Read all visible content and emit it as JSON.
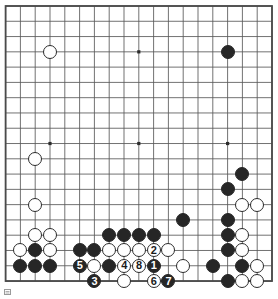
{
  "board": {
    "name": "go-board",
    "size": 19,
    "origin_x": 5.6,
    "origin_y": 6.0,
    "pitch_x": 14.8,
    "pitch_y": 15.28,
    "stone_radius": 7.0,
    "line_color": "#595959",
    "border_color": "#4a4a4a",
    "background_color": "#ffffff",
    "black_color": "#262626",
    "white_color": "#ffffff",
    "star_points": [
      {
        "col": 4,
        "row": 4
      },
      {
        "col": 10,
        "row": 4
      },
      {
        "col": 16,
        "row": 4
      },
      {
        "col": 4,
        "row": 10
      },
      {
        "col": 10,
        "row": 10
      },
      {
        "col": 16,
        "row": 10
      },
      {
        "col": 4,
        "row": 16
      },
      {
        "col": 10,
        "row": 16
      },
      {
        "col": 16,
        "row": 16
      }
    ]
  },
  "stones": [
    {
      "col": 4,
      "row": 4,
      "color": "white",
      "label": ""
    },
    {
      "col": 16,
      "row": 4,
      "color": "black",
      "label": ""
    },
    {
      "col": 3,
      "row": 11,
      "color": "white",
      "label": ""
    },
    {
      "col": 3,
      "row": 14,
      "color": "white",
      "label": ""
    },
    {
      "col": 17,
      "row": 12,
      "color": "black",
      "label": ""
    },
    {
      "col": 16,
      "row": 13,
      "color": "black",
      "label": ""
    },
    {
      "col": 17,
      "row": 14,
      "color": "white",
      "label": ""
    },
    {
      "col": 18,
      "row": 14,
      "color": "white",
      "label": ""
    },
    {
      "col": 13,
      "row": 15,
      "color": "black",
      "label": ""
    },
    {
      "col": 16,
      "row": 15,
      "color": "black",
      "label": ""
    },
    {
      "col": 3,
      "row": 16,
      "color": "white",
      "label": ""
    },
    {
      "col": 4,
      "row": 16,
      "color": "white",
      "label": ""
    },
    {
      "col": 8,
      "row": 16,
      "color": "black",
      "label": ""
    },
    {
      "col": 9,
      "row": 16,
      "color": "black",
      "label": ""
    },
    {
      "col": 10,
      "row": 16,
      "color": "black",
      "label": ""
    },
    {
      "col": 11,
      "row": 16,
      "color": "black",
      "label": ""
    },
    {
      "col": 16,
      "row": 16,
      "color": "black",
      "label": ""
    },
    {
      "col": 17,
      "row": 16,
      "color": "white",
      "label": ""
    },
    {
      "col": 2,
      "row": 17,
      "color": "white",
      "label": ""
    },
    {
      "col": 3,
      "row": 17,
      "color": "black",
      "label": ""
    },
    {
      "col": 4,
      "row": 17,
      "color": "white",
      "label": ""
    },
    {
      "col": 6,
      "row": 17,
      "color": "black",
      "label": ""
    },
    {
      "col": 7,
      "row": 17,
      "color": "black",
      "label": ""
    },
    {
      "col": 8,
      "row": 17,
      "color": "white",
      "label": ""
    },
    {
      "col": 9,
      "row": 17,
      "color": "white",
      "label": ""
    },
    {
      "col": 10,
      "row": 17,
      "color": "white",
      "label": ""
    },
    {
      "col": 11,
      "row": 17,
      "color": "white",
      "label": "2"
    },
    {
      "col": 12,
      "row": 17,
      "color": "white",
      "label": ""
    },
    {
      "col": 16,
      "row": 17,
      "color": "black",
      "label": ""
    },
    {
      "col": 17,
      "row": 17,
      "color": "white",
      "label": ""
    },
    {
      "col": 2,
      "row": 18,
      "color": "black",
      "label": ""
    },
    {
      "col": 3,
      "row": 18,
      "color": "black",
      "label": ""
    },
    {
      "col": 4,
      "row": 18,
      "color": "black",
      "label": ""
    },
    {
      "col": 6,
      "row": 18,
      "color": "black",
      "label": "5"
    },
    {
      "col": 7,
      "row": 18,
      "color": "white",
      "label": ""
    },
    {
      "col": 8,
      "row": 18,
      "color": "black",
      "label": ""
    },
    {
      "col": 9,
      "row": 18,
      "color": "white",
      "label": "4"
    },
    {
      "col": 10,
      "row": 18,
      "color": "white",
      "label": "8"
    },
    {
      "col": 11,
      "row": 18,
      "color": "black",
      "label": "1"
    },
    {
      "col": 13,
      "row": 18,
      "color": "white",
      "label": ""
    },
    {
      "col": 15,
      "row": 18,
      "color": "black",
      "label": ""
    },
    {
      "col": 17,
      "row": 18,
      "color": "black",
      "label": ""
    },
    {
      "col": 18,
      "row": 18,
      "color": "white",
      "label": ""
    },
    {
      "col": 7,
      "row": 19,
      "color": "black",
      "label": "3"
    },
    {
      "col": 9,
      "row": 19,
      "color": "white",
      "label": ""
    },
    {
      "col": 11,
      "row": 19,
      "color": "white",
      "label": "6"
    },
    {
      "col": 12,
      "row": 19,
      "color": "black",
      "label": "7"
    },
    {
      "col": 16,
      "row": 19,
      "color": "black",
      "label": ""
    },
    {
      "col": 17,
      "row": 19,
      "color": "white",
      "label": ""
    },
    {
      "col": 18,
      "row": 19,
      "color": "white",
      "label": ""
    }
  ],
  "move_sequence": {
    "name": "numbered-move-sequence",
    "moves": [
      "1",
      "2",
      "3",
      "4",
      "5",
      "6",
      "7",
      "8"
    ]
  },
  "footer": {
    "mark_label": ""
  }
}
